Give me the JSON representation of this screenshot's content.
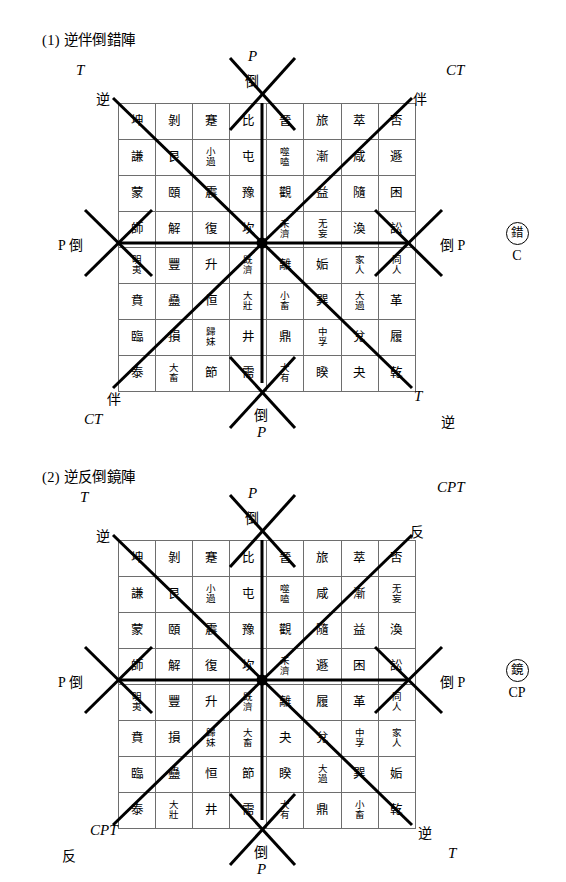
{
  "page": {
    "width": 566,
    "height": 882,
    "background": "#ffffff",
    "ink": "#000000",
    "grid_line_color": "#6e6e6e"
  },
  "figures": [
    {
      "id": "figure-1",
      "title": "(1) 逆伴倒錯陣",
      "badge": {
        "ring_char": "錯",
        "sub_label": "C"
      },
      "labels": {
        "top_center_outer": "P",
        "top_center_inner": "倒",
        "top_left_outer": "T",
        "top_left_inner": "逆",
        "top_right_outer": "CT",
        "top_right_inner": "伴",
        "left_middle": "P 倒",
        "right_middle": "倒 P",
        "bottom_left_inner": "伴",
        "bottom_left_outer": "CT",
        "bottom_center_inner": "倒",
        "bottom_center_outer": "P",
        "bottom_right_inner": "T",
        "bottom_right_outer": "逆"
      },
      "matrix": [
        [
          "坤",
          "剝",
          "蹇",
          "比",
          "晉",
          "旅",
          "萃",
          "否"
        ],
        [
          "謙",
          "艮",
          "小過",
          "屯",
          "噬嗑",
          "漸",
          "咸",
          "遯"
        ],
        [
          "蒙",
          "頤",
          "震",
          "豫",
          "觀",
          "益",
          "隨",
          "困"
        ],
        [
          "師",
          "解",
          "復",
          "坎",
          "未濟",
          "无妄",
          "渙",
          "訟"
        ],
        [
          "明夷",
          "豐",
          "升",
          "既濟",
          "離",
          "姤",
          "家人",
          "同人"
        ],
        [
          "賁",
          "蠱",
          "恒",
          "大壯",
          "小畜",
          "巽",
          "大過",
          "革"
        ],
        [
          "臨",
          "損",
          "歸妹",
          "井",
          "鼎",
          "中孚",
          "兌",
          "履"
        ],
        [
          "泰",
          "大畜",
          "節",
          "需",
          "大有",
          "睽",
          "夬",
          "乾"
        ]
      ]
    },
    {
      "id": "figure-2",
      "title": "(2) 逆反倒鏡陣",
      "badge": {
        "ring_char": "鏡",
        "sub_label": "CP"
      },
      "labels": {
        "top_center_outer": "P",
        "top_center_inner": "倒",
        "top_left_outer": "T",
        "top_left_inner": "逆",
        "top_right_outer": "CPT",
        "top_right_inner": "反",
        "left_middle": "P 倒",
        "right_middle": "倒 P",
        "bottom_left_inner": "CPT",
        "bottom_left_outer": "反",
        "bottom_center_inner": "倒",
        "bottom_center_outer": "P",
        "bottom_right_inner": "逆",
        "bottom_right_outer": "T"
      },
      "matrix": [
        [
          "坤",
          "剝",
          "蹇",
          "比",
          "晉",
          "旅",
          "萃",
          "否"
        ],
        [
          "謙",
          "艮",
          "小過",
          "屯",
          "噬嗑",
          "咸",
          "漸",
          "无妄"
        ],
        [
          "蒙",
          "頤",
          "震",
          "豫",
          "觀",
          "隨",
          "益",
          "渙"
        ],
        [
          "師",
          "解",
          "復",
          "坎",
          "未濟",
          "遯",
          "困",
          "訟"
        ],
        [
          "明夷",
          "豐",
          "升",
          "既濟",
          "離",
          "履",
          "革",
          "同人"
        ],
        [
          "賁",
          "損",
          "歸妹",
          "大畜",
          "夬",
          "兌",
          "中孚",
          "家人"
        ],
        [
          "臨",
          "蠱",
          "恒",
          "節",
          "睽",
          "大過",
          "巽",
          "姤"
        ],
        [
          "泰",
          "大壯",
          "井",
          "需",
          "大有",
          "鼎",
          "小畜",
          "乾"
        ]
      ]
    }
  ]
}
